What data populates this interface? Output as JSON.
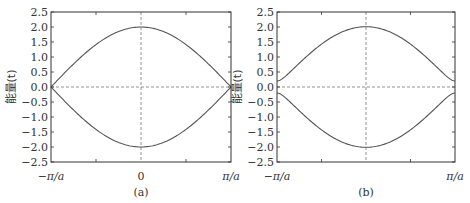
{
  "chart_data": [
    {
      "type": "line",
      "panel": "(a)",
      "title": "",
      "xlabel": "",
      "ylabel": "能量(t)",
      "caption": "(a)",
      "xticks": [
        "−π/a",
        "0",
        "π/a"
      ],
      "yticks": [
        "2.5",
        "2.0",
        "1.5",
        "1.0",
        "0.5",
        "0.0",
        "−0.5",
        "−1.0",
        "−1.5",
        "−2.0",
        "−2.5"
      ],
      "ylim": [
        -2.5,
        2.5
      ],
      "xlim": [
        "-pi/a",
        "pi/a"
      ],
      "grid": false,
      "reference_lines": [
        "y=0 dashed",
        "x=0 dashed"
      ],
      "x": [
        -1.0,
        -0.75,
        -0.5,
        -0.25,
        0.0,
        0.25,
        0.5,
        0.75,
        1.0
      ],
      "series": [
        {
          "name": "upper band",
          "values": [
            0.0,
            0.77,
            1.41,
            1.85,
            2.0,
            1.85,
            1.41,
            0.77,
            0.0
          ]
        },
        {
          "name": "lower band",
          "values": [
            0.0,
            -0.77,
            -1.41,
            -1.85,
            -2.0,
            -1.85,
            -1.41,
            -0.77,
            0.0
          ]
        }
      ],
      "gap": 0.0
    },
    {
      "type": "line",
      "panel": "(b)",
      "title": "",
      "xlabel": "",
      "ylabel": "能量(t)",
      "caption": "(b)",
      "xticks": [
        "−π/a",
        "π/a"
      ],
      "yticks": [
        "2.5",
        "2.0",
        "1.5",
        "1.0",
        "0.5",
        "0.0",
        "−0.5",
        "−1.0",
        "−1.5",
        "−2.0",
        "−2.5"
      ],
      "ylim": [
        -2.5,
        2.5
      ],
      "xlim": [
        "-pi/a",
        "pi/a"
      ],
      "grid": false,
      "reference_lines": [
        "y=0 dashed",
        "x=0 dashed"
      ],
      "x": [
        -1.0,
        -0.75,
        -0.5,
        -0.25,
        0.0,
        0.25,
        0.5,
        0.75,
        1.0
      ],
      "series": [
        {
          "name": "upper band",
          "values": [
            0.2,
            0.8,
            1.42,
            1.86,
            2.0,
            1.86,
            1.42,
            0.8,
            0.2
          ]
        },
        {
          "name": "lower band",
          "values": [
            -0.2,
            -0.8,
            -1.42,
            -1.86,
            -2.0,
            -1.86,
            -1.42,
            -0.8,
            -0.2
          ]
        }
      ],
      "gap": 0.2
    }
  ]
}
